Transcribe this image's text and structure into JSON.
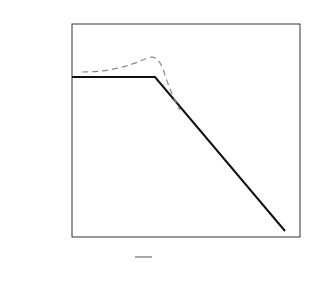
{
  "chart_data": {
    "type": "line",
    "title": "",
    "ylabel": "A_dB",
    "xlabel": "ω (rad/s)",
    "ylim": [
      -45,
      15
    ],
    "yticks": [
      15,
      10,
      5,
      0,
      -5,
      -10,
      -15,
      -20,
      -25,
      -30,
      -35,
      -40,
      -45
    ],
    "xtick_labels": [
      "ωn/2",
      "ωn",
      "ω0"
    ],
    "x_scale": "log",
    "grid": true,
    "series": [
      {
        "name": "asymptote",
        "style": "solid",
        "description": "0 dB until ωn, then -40 dB/decade"
      },
      {
        "name": "actual",
        "style": "dashed",
        "description": "resonant peak near ωn"
      }
    ],
    "annotations": [
      "(2.2)",
      "(8.14)",
      "(7.96)",
      "(0)"
    ]
  },
  "labels": {
    "ylabel_main": "A",
    "ylabel_sub": "dB",
    "xlabel": "ω (rad/s)",
    "wn": "ω",
    "wn_sub": "n",
    "w0": "ω",
    "w0_sub": "0",
    "half_num": "ω",
    "half_sub": "n",
    "half_den": "2"
  }
}
